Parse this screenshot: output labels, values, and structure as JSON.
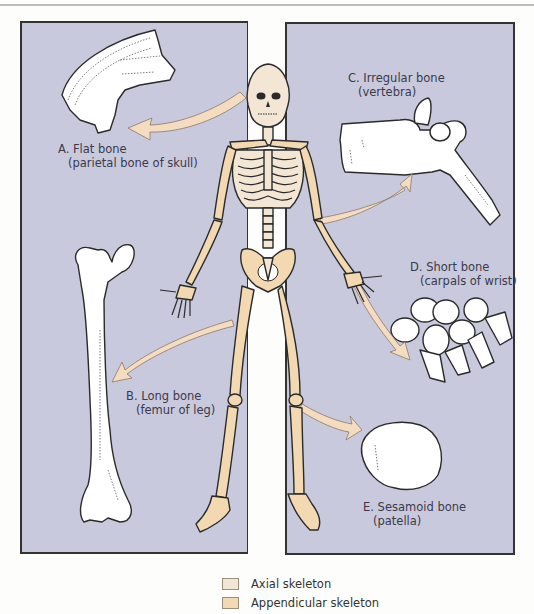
{
  "figure": {
    "type": "anatomical-diagram"
  },
  "labels": {
    "flat": {
      "title": "A. Flat bone",
      "example": "(parietal bone of skull)"
    },
    "long": {
      "title": "B. Long bone",
      "example": "(femur of leg)"
    },
    "irregular": {
      "title": "C. Irregular bone",
      "example": "(vertebra)"
    },
    "short": {
      "title": "D. Short bone",
      "example": "(carpals of wrist)"
    },
    "sesamoid": {
      "title": "E. Sesamoid bone",
      "example": "(patella)"
    }
  },
  "legend": {
    "items": [
      {
        "label": "Axial skeleton",
        "color": "#f3e6d4"
      },
      {
        "label": "Appendicular skeleton",
        "color": "#f2d9b1"
      }
    ]
  },
  "colors": {
    "panel": "#c9c9dd",
    "axial": "#f3e6d4",
    "appendicular": "#f2d9b1",
    "arrow": "#f4dcc0",
    "outline": "#2a2a2a"
  }
}
